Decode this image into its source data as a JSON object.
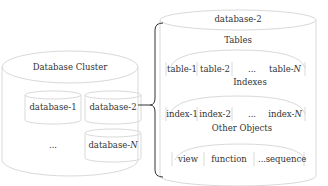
{
  "cluster": {
    "title": "Database Cluster",
    "databases": [
      {
        "label": "database-1"
      },
      {
        "label": "database-2"
      },
      {
        "label": "...",
        "is_ellipsis": true
      },
      {
        "label_prefix": "database-",
        "label_italic": "N"
      }
    ]
  },
  "detail": {
    "title": "database-2",
    "sections": [
      {
        "title": "Tables",
        "items": [
          "table-1",
          "table-2",
          "...",
          "table-"
        ],
        "last_italic": "N"
      },
      {
        "title": "Indexes",
        "items": [
          "index-1",
          "index-2",
          "...",
          "index-"
        ],
        "last_italic": "N"
      },
      {
        "title": "Other Objects",
        "items": [
          "view",
          "function",
          "...",
          "sequence"
        ]
      }
    ]
  },
  "colors": {
    "stroke": "#d8d8d8",
    "brace": "#333333",
    "text": "#333333"
  }
}
